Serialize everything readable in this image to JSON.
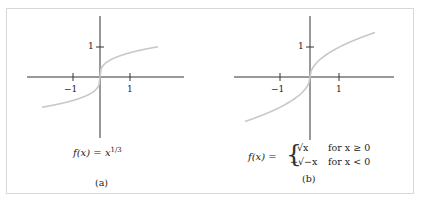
{
  "chart_data": [
    {
      "type": "line",
      "panel_label": "(a)",
      "formula": "f(x) = x^{1/3}",
      "formula_display": {
        "lhs": "f(x) =",
        "base": "x",
        "exp": "1/3"
      },
      "series": [
        {
          "name": "x^(1/3)",
          "color": "#c8c8c8",
          "x": [
            -2,
            -1.5,
            -1,
            -0.5,
            -0.125,
            -0.01,
            0,
            0.01,
            0.125,
            0.5,
            1,
            1.5,
            2
          ],
          "y": [
            -1.26,
            -1.145,
            -1,
            -0.794,
            -0.5,
            -0.215,
            0,
            0.215,
            0.5,
            0.794,
            1,
            1.145,
            1.26
          ]
        }
      ],
      "x_ticks": [
        "-1",
        "1"
      ],
      "y_ticks": [
        "1"
      ],
      "xlim": [
        -2.4,
        2.4
      ],
      "ylim": [
        -2.2,
        2.2
      ],
      "grid": false
    },
    {
      "type": "line",
      "panel_label": "(b)",
      "formula": "f(x) = { sqrt(x) for x >= 0 ; -sqrt(-x) for x < 0 }",
      "formula_display": {
        "lhs": "f(x) =",
        "case1_expr": "√x",
        "case1_cond": "for x ≥ 0",
        "case2_expr": "−√−x",
        "case2_cond": "for x < 0"
      },
      "series": [
        {
          "name": "signed sqrt",
          "color": "#c8c8c8",
          "x": [
            -2.2,
            -1.5,
            -1,
            -0.5,
            -0.1,
            0,
            0.1,
            0.5,
            1,
            1.5,
            2.2
          ],
          "y": [
            -1.48,
            -1.22,
            -1,
            -0.707,
            -0.316,
            0,
            0.316,
            0.707,
            1,
            1.22,
            1.48
          ]
        }
      ],
      "x_ticks": [
        "-1",
        "1"
      ],
      "y_ticks": [
        "1"
      ],
      "xlim": [
        -2.4,
        2.4
      ],
      "ylim": [
        -2.2,
        2.2
      ],
      "grid": false
    }
  ],
  "labels": {
    "a_tick_neg1": "−1",
    "a_tick_1x": "1",
    "a_tick_1y": "1",
    "b_tick_neg1": "−1",
    "b_tick_1x": "1",
    "b_tick_1y": "1",
    "a_lhs": "f(x) = ",
    "a_base": "x",
    "a_exp": "1/3",
    "a_caption": "(a)",
    "b_lhs": "f(x) = ",
    "b_c1e": "√x",
    "b_c1c": "for x ≥ 0",
    "b_c2e": "−√−x",
    "b_c2c": "for x < 0",
    "b_caption": "(b)"
  }
}
